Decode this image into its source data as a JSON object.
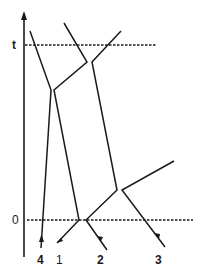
{
  "axis": {
    "time_label_t": "t",
    "time_label_0": "0"
  },
  "particles": [
    {
      "id": "4",
      "label": "4"
    },
    {
      "id": "1",
      "label": "1"
    },
    {
      "id": "2",
      "label": "2"
    },
    {
      "id": "3",
      "label": "3"
    }
  ],
  "colors": {
    "line": "#1a1a1a",
    "background": "#ffffff"
  }
}
